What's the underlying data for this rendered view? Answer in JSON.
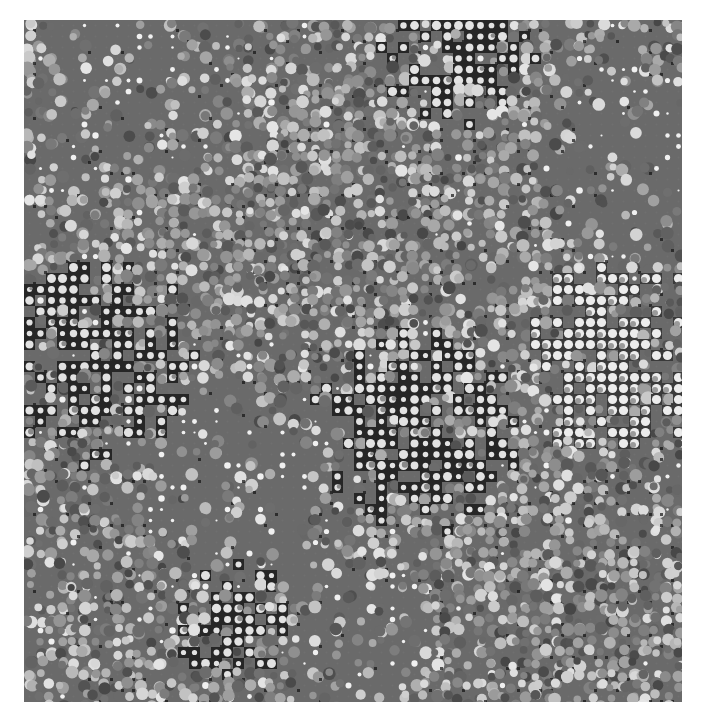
{
  "image": {
    "description": "Abstract grayscale halftone dot pattern with overlapping dark, light and mid-gray regions",
    "frame": {
      "x": 24,
      "y": 20,
      "width": 658,
      "height": 682
    },
    "palette": {
      "background_gray": "#6a6a6a",
      "dark": "#262626",
      "light_dot": "#e2e2e2",
      "mid_dot": "#8a8a8a",
      "page": "#ffffff"
    },
    "dot_spacing_px": 11,
    "regions": [
      {
        "name": "gray-top-left",
        "type": "gray",
        "cx": 0.18,
        "cy": 0.08,
        "r": 0.22
      },
      {
        "name": "dark-top-center",
        "type": "dark",
        "cx": 0.66,
        "cy": 0.05,
        "r": 0.13
      },
      {
        "name": "gray-top-right",
        "type": "gray",
        "cx": 0.95,
        "cy": 0.2,
        "r": 0.18
      },
      {
        "name": "textured-upper-band",
        "type": "texture",
        "cx": 0.4,
        "cy": 0.27,
        "r": 0.3
      },
      {
        "name": "dark-left",
        "type": "dark",
        "cx": 0.1,
        "cy": 0.5,
        "r": 0.17
      },
      {
        "name": "gray-center-left",
        "type": "gray",
        "cx": 0.33,
        "cy": 0.68,
        "r": 0.2
      },
      {
        "name": "dark-center",
        "type": "dark",
        "cx": 0.6,
        "cy": 0.6,
        "r": 0.17
      },
      {
        "name": "light-right",
        "type": "light",
        "cx": 0.9,
        "cy": 0.5,
        "r": 0.16
      },
      {
        "name": "gray-bottom-center",
        "type": "gray",
        "cx": 0.5,
        "cy": 0.88,
        "r": 0.12
      },
      {
        "name": "dark-bottom-left",
        "type": "dark",
        "cx": 0.32,
        "cy": 0.88,
        "r": 0.1
      },
      {
        "name": "textured-bottom-right",
        "type": "texture",
        "cx": 0.82,
        "cy": 0.85,
        "r": 0.2
      }
    ]
  }
}
